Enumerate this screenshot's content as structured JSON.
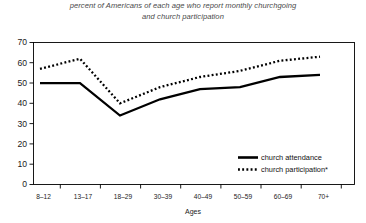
{
  "chart_data": {
    "type": "line",
    "title": "percent of Americans of each age who report monthly churchgoing and church participation",
    "title_line1": "percent of Americans of each age who report monthly churchgoing",
    "title_line2": "and church participation",
    "xlabel": "Ages",
    "ylabel": "",
    "categories": [
      "8–12",
      "13–17",
      "18–29",
      "30–39",
      "40–49",
      "50–59",
      "60–69",
      "70+"
    ],
    "yticks": [
      "0",
      "10",
      "20",
      "30",
      "40",
      "50",
      "60",
      "70"
    ],
    "ylim": [
      0,
      70
    ],
    "grid": false,
    "legend_position": "inside-bottom-right",
    "series": [
      {
        "name": "church attendance",
        "style": "solid",
        "color": "#000000",
        "values": [
          50,
          50,
          34,
          42,
          47,
          48,
          53,
          54
        ]
      },
      {
        "name": "church participation*",
        "style": "dotted",
        "color": "#000000",
        "values": [
          57,
          62,
          40,
          48,
          53,
          56,
          61,
          63
        ]
      }
    ]
  },
  "legend": {
    "item1_label": "church attendance",
    "item2_label": "church participation*"
  }
}
